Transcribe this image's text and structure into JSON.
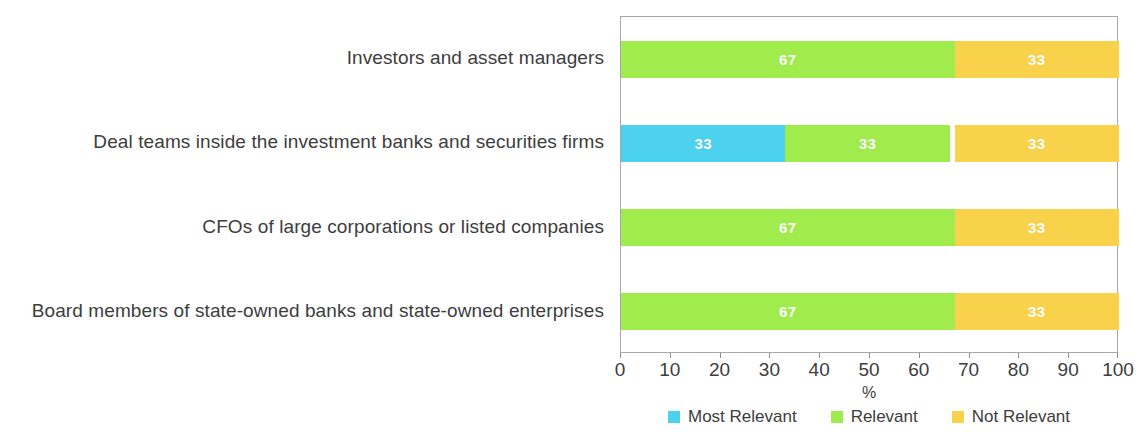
{
  "chart_data": {
    "type": "bar",
    "orientation": "horizontal",
    "stacked": true,
    "stack_mode": "percent",
    "title": "",
    "subtitle": "",
    "xlabel": "%",
    "ylabel": "",
    "xlim": [
      0,
      100
    ],
    "xticks": [
      0,
      10,
      20,
      30,
      40,
      50,
      60,
      70,
      80,
      90,
      100
    ],
    "xtick_labels": [
      "0",
      "10",
      "20",
      "30",
      "40",
      "50",
      "60",
      "70",
      "80",
      "90",
      "100"
    ],
    "grid": false,
    "legend_position": "bottom",
    "categories": [
      "Investors and asset managers",
      "Deal teams inside the investment banks and securities firms",
      "CFOs of large corporations or listed companies",
      "Board members of state-owned banks and state-owned enterprises"
    ],
    "series": [
      {
        "name": "Most Relevant",
        "color": "#4CD2EF",
        "values": [
          0,
          33,
          0,
          0
        ],
        "labels": [
          "",
          "33",
          "",
          ""
        ]
      },
      {
        "name": "Relevant",
        "color": "#A0EC4C",
        "values": [
          67,
          33,
          67,
          67
        ],
        "labels": [
          "67",
          "33",
          "67",
          "67"
        ]
      },
      {
        "name": "Not Relevant",
        "color": "#F9D24B",
        "values": [
          33,
          33,
          33,
          33
        ],
        "labels": [
          "33",
          "33",
          "33",
          "33"
        ]
      }
    ],
    "bars": [
      {
        "category": "Investors and asset managers",
        "segments": [
          {
            "series": "Relevant",
            "value": 67,
            "label": "67",
            "color": "#A0EC4C",
            "start": 0
          },
          {
            "series": "Not Relevant",
            "value": 33,
            "label": "33",
            "color": "#F9D24B",
            "start": 67
          }
        ]
      },
      {
        "category": "Deal teams inside the investment banks and securities firms",
        "segments": [
          {
            "series": "Most Relevant",
            "value": 33,
            "label": "33",
            "color": "#4CD2EF",
            "start": 0
          },
          {
            "series": "Relevant",
            "value": 33,
            "label": "33",
            "color": "#A0EC4C",
            "start": 33
          },
          {
            "series": "Not Relevant",
            "value": 33,
            "label": "33",
            "color": "#F9D24B",
            "start": 67
          }
        ]
      },
      {
        "category": "CFOs of large corporations or listed companies",
        "segments": [
          {
            "series": "Relevant",
            "value": 67,
            "label": "67",
            "color": "#A0EC4C",
            "start": 0
          },
          {
            "series": "Not Relevant",
            "value": 33,
            "label": "33",
            "color": "#F9D24B",
            "start": 67
          }
        ]
      },
      {
        "category": "Board members of state-owned banks and state-owned enterprises",
        "segments": [
          {
            "series": "Relevant",
            "value": 67,
            "label": "67",
            "color": "#A0EC4C",
            "start": 0
          },
          {
            "series": "Not Relevant",
            "value": 33,
            "label": "33",
            "color": "#F9D24B",
            "start": 67
          }
        ]
      }
    ]
  },
  "axis": {
    "x_title": "%"
  },
  "legend": {
    "items": [
      {
        "label": "Most Relevant",
        "color": "#4CD2EF"
      },
      {
        "label": "Relevant",
        "color": "#A0EC4C"
      },
      {
        "label": "Not Relevant",
        "color": "#F9D24B"
      }
    ]
  },
  "colors": {
    "most_relevant": "#4CD2EF",
    "relevant": "#A0EC4C",
    "not_relevant": "#F9D24B",
    "axis": "#a8a8a8",
    "text": "#3d3d3d",
    "background": "#ffffff"
  }
}
